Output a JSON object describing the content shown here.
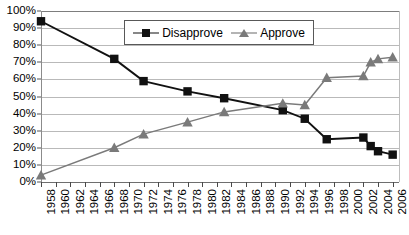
{
  "chart_data": {
    "type": "line",
    "title": "",
    "subtitle": "",
    "xlabel": "",
    "ylabel": "",
    "ylim": [
      0,
      100
    ],
    "ytick_values": [
      0,
      10,
      20,
      30,
      40,
      50,
      60,
      70,
      80,
      90,
      100
    ],
    "ytick_labels": [
      "0%",
      "10%",
      "20%",
      "30%",
      "40%",
      "50%",
      "60%",
      "70%",
      "80%",
      "90%",
      "100%"
    ],
    "xlim": [
      1958,
      2007
    ],
    "xtick_labels": [
      "1958",
      "1960",
      "1962",
      "1964",
      "1966",
      "1968",
      "1970",
      "1972",
      "1974",
      "1976",
      "1978",
      "1980",
      "1982",
      "1984",
      "1986",
      "1988",
      "1990",
      "1992",
      "1994",
      "1996",
      "1998",
      "2000",
      "2002",
      "2004",
      "2006"
    ],
    "xtick_values": [
      1958,
      1960,
      1962,
      1964,
      1966,
      1968,
      1970,
      1972,
      1974,
      1976,
      1978,
      1980,
      1982,
      1984,
      1986,
      1988,
      1990,
      1992,
      1994,
      1996,
      1998,
      2000,
      2002,
      2004,
      2006
    ],
    "grid": true,
    "legend_position": "top-center",
    "series": [
      {
        "name": "Disapprove",
        "marker": "square",
        "color": "#111111",
        "points": [
          {
            "x": 1958,
            "y": 94
          },
          {
            "x": 1968,
            "y": 72
          },
          {
            "x": 1972,
            "y": 59
          },
          {
            "x": 1978,
            "y": 53
          },
          {
            "x": 1983,
            "y": 49
          },
          {
            "x": 1991,
            "y": 42
          },
          {
            "x": 1994,
            "y": 37
          },
          {
            "x": 1997,
            "y": 25
          },
          {
            "x": 2002,
            "y": 26
          },
          {
            "x": 2003,
            "y": 21
          },
          {
            "x": 2004,
            "y": 18
          },
          {
            "x": 2006,
            "y": 16
          }
        ]
      },
      {
        "name": "Approve",
        "marker": "triangle",
        "color": "#7a7a7a",
        "points": [
          {
            "x": 1958,
            "y": 4
          },
          {
            "x": 1968,
            "y": 20
          },
          {
            "x": 1972,
            "y": 28
          },
          {
            "x": 1978,
            "y": 35
          },
          {
            "x": 1983,
            "y": 41
          },
          {
            "x": 1991,
            "y": 46
          },
          {
            "x": 1994,
            "y": 45
          },
          {
            "x": 1997,
            "y": 61
          },
          {
            "x": 2002,
            "y": 62
          },
          {
            "x": 2003,
            "y": 70
          },
          {
            "x": 2004,
            "y": 72
          },
          {
            "x": 2006,
            "y": 73
          }
        ]
      }
    ]
  },
  "legend": {
    "entries": [
      {
        "label": "Disapprove",
        "marker": "square-marker-icon"
      },
      {
        "label": "Approve",
        "marker": "triangle-marker-icon"
      }
    ]
  }
}
